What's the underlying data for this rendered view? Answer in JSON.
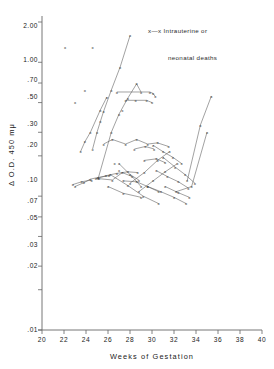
{
  "chart": {
    "type": "scatter",
    "xlabel": "Weeks of Gestation",
    "ylabel": "Δ O.D. 450 mμ",
    "title": "",
    "legend": {
      "marker": "x—x",
      "line1": "Intrauterine or",
      "line2": "neonatal deaths",
      "position": "top-right"
    },
    "x_ticks": [
      "20",
      "22",
      "24",
      "26",
      "28",
      "30",
      "32",
      "34",
      "36",
      "38",
      "40"
    ],
    "y_ticks": [
      "2.00",
      "1.00",
      ".70",
      ".50",
      ".30",
      ".20",
      ".10",
      ".07",
      ".05",
      ".03",
      ".02",
      ".01"
    ],
    "xlim": [
      20,
      40
    ],
    "ylim": [
      0.01,
      2.0
    ],
    "yscale": "log",
    "grid": false,
    "marker_symbol": "x",
    "line_color": "#555555",
    "axis_color": "#666666"
  },
  "chart_data": {
    "type": "scatter",
    "title": "",
    "xlabel": "Weeks of Gestation",
    "ylabel": "Δ O.D. 450 mμ",
    "xlim": [
      20,
      40
    ],
    "ylim": [
      0.01,
      2.0
    ],
    "yscale": "log",
    "grid": false,
    "legend": [
      "x—x Intrauterine or neonatal deaths"
    ],
    "x_tick_values": [
      20,
      22,
      24,
      26,
      28,
      30,
      32,
      34,
      36,
      38,
      40
    ],
    "y_tick_values": [
      2.0,
      1.0,
      0.7,
      0.5,
      0.3,
      0.2,
      0.1,
      0.07,
      0.05,
      0.03,
      0.02,
      0.01
    ],
    "isolated_points": [
      {
        "x": 22.1,
        "y": 1.3
      },
      {
        "x": 24.6,
        "y": 1.3
      },
      {
        "x": 23.9,
        "y": 0.62
      },
      {
        "x": 23.0,
        "y": 0.5
      },
      {
        "x": 27.3,
        "y": 0.44
      },
      {
        "x": 26.6,
        "y": 0.175
      },
      {
        "x": 27.0,
        "y": 0.155
      }
    ],
    "series": [
      {
        "name": "case-1",
        "points": [
          [
            24.6,
            0.225
          ],
          [
            25.0,
            0.3
          ],
          [
            25.3,
            0.36
          ],
          [
            25.6,
            0.43
          ],
          [
            26.3,
            0.62
          ],
          [
            27.1,
            0.92
          ],
          [
            28.0,
            1.58
          ]
        ]
      },
      {
        "name": "case-2",
        "points": [
          [
            23.5,
            0.215
          ],
          [
            23.9,
            0.255
          ],
          [
            24.4,
            0.3
          ],
          [
            25.3,
            0.44
          ],
          [
            25.9,
            0.55
          ]
        ]
      },
      {
        "name": "case-3",
        "points": [
          [
            25.1,
            0.135
          ],
          [
            26.3,
            0.3
          ],
          [
            27.0,
            0.41
          ],
          [
            27.8,
            0.54
          ],
          [
            28.6,
            0.69
          ],
          [
            29.0,
            0.6
          ]
        ]
      },
      {
        "name": "case-4",
        "points": [
          [
            26.8,
            0.6
          ],
          [
            29.8,
            0.6
          ],
          [
            30.1,
            0.585
          ],
          [
            30.3,
            0.555
          ]
        ]
      },
      {
        "name": "case-5",
        "points": [
          [
            27.6,
            0.52
          ],
          [
            28.5,
            0.52
          ],
          [
            29.5,
            0.52
          ],
          [
            30.0,
            0.5
          ]
        ]
      },
      {
        "name": "case-6",
        "points": [
          [
            25.6,
            0.245
          ],
          [
            26.4,
            0.265
          ],
          [
            27.6,
            0.245
          ],
          [
            28.6,
            0.265
          ],
          [
            29.6,
            0.245
          ],
          [
            30.5,
            0.25
          ],
          [
            31.5,
            0.235
          ]
        ]
      },
      {
        "name": "case-7",
        "points": [
          [
            24.9,
            0.135
          ],
          [
            25.8,
            0.142
          ],
          [
            26.8,
            0.148
          ],
          [
            27.8,
            0.152
          ],
          [
            28.7,
            0.15
          ]
        ]
      },
      {
        "name": "case-8",
        "points": [
          [
            23.0,
            0.118
          ],
          [
            23.8,
            0.126
          ],
          [
            24.4,
            0.134
          ],
          [
            25.1,
            0.138
          ],
          [
            26.1,
            0.142
          ]
        ]
      },
      {
        "name": "case-9",
        "points": [
          [
            22.8,
            0.122
          ],
          [
            23.6,
            0.128
          ],
          [
            24.5,
            0.132
          ]
        ]
      },
      {
        "name": "case-10",
        "points": [
          [
            25.2,
            0.135
          ],
          [
            26.4,
            0.132
          ],
          [
            27.3,
            0.15
          ],
          [
            28.2,
            0.14
          ],
          [
            29.0,
            0.118
          ]
        ]
      },
      {
        "name": "case-11",
        "points": [
          [
            26.0,
            0.118
          ],
          [
            27.4,
            0.105
          ],
          [
            29.0,
            0.098
          ]
        ]
      },
      {
        "name": "case-12",
        "points": [
          [
            27.0,
            0.175
          ],
          [
            28.0,
            0.145
          ],
          [
            28.8,
            0.132
          ]
        ]
      },
      {
        "name": "case-13",
        "points": [
          [
            28.4,
            0.225
          ],
          [
            29.4,
            0.235
          ],
          [
            30.2,
            0.225
          ]
        ]
      },
      {
        "name": "case-14",
        "points": [
          [
            29.3,
            0.185
          ],
          [
            30.4,
            0.19
          ],
          [
            31.2,
            0.178
          ]
        ]
      },
      {
        "name": "case-15",
        "points": [
          [
            28.0,
            0.125
          ],
          [
            29.3,
            0.15
          ],
          [
            30.5,
            0.185
          ],
          [
            31.6,
            0.215
          ]
        ]
      },
      {
        "name": "case-16",
        "points": [
          [
            28.8,
            0.108
          ],
          [
            30.1,
            0.13
          ],
          [
            31.2,
            0.152
          ],
          [
            32.3,
            0.175
          ]
        ]
      },
      {
        "name": "case-17",
        "points": [
          [
            30.1,
            0.24
          ],
          [
            31.0,
            0.215
          ],
          [
            31.9,
            0.195
          ],
          [
            32.7,
            0.175
          ]
        ]
      },
      {
        "name": "case-18",
        "points": [
          [
            30.4,
            0.155
          ],
          [
            31.4,
            0.14
          ],
          [
            32.4,
            0.128
          ],
          [
            33.3,
            0.115
          ]
        ]
      },
      {
        "name": "case-19",
        "points": [
          [
            31.2,
            0.118
          ],
          [
            32.4,
            0.106
          ],
          [
            33.4,
            0.098
          ]
        ]
      },
      {
        "name": "case-20",
        "points": [
          [
            29.6,
            0.118
          ],
          [
            30.8,
            0.108
          ],
          [
            32.0,
            0.098
          ],
          [
            33.1,
            0.088
          ]
        ]
      },
      {
        "name": "case-21",
        "points": [
          [
            31.0,
            0.195
          ],
          [
            32.1,
            0.165
          ],
          [
            33.0,
            0.145
          ],
          [
            33.9,
            0.125
          ]
        ]
      },
      {
        "name": "case-22",
        "points": [
          [
            26.2,
            0.145
          ],
          [
            27.8,
            0.12
          ],
          [
            29.2,
            0.1
          ],
          [
            30.6,
            0.088
          ]
        ]
      },
      {
        "name": "case-23",
        "points": [
          [
            32.2,
            0.108
          ],
          [
            33.6,
            0.118
          ],
          [
            35.0,
            0.3
          ]
        ]
      },
      {
        "name": "case-24",
        "points": [
          [
            33.2,
            0.13
          ],
          [
            34.4,
            0.34
          ],
          [
            35.4,
            0.56
          ]
        ]
      },
      {
        "name": "case-25",
        "points": [
          [
            27.4,
            0.13
          ],
          [
            28.6,
            0.128
          ],
          [
            29.6,
            0.118
          ],
          [
            30.6,
            0.108
          ]
        ]
      }
    ]
  }
}
